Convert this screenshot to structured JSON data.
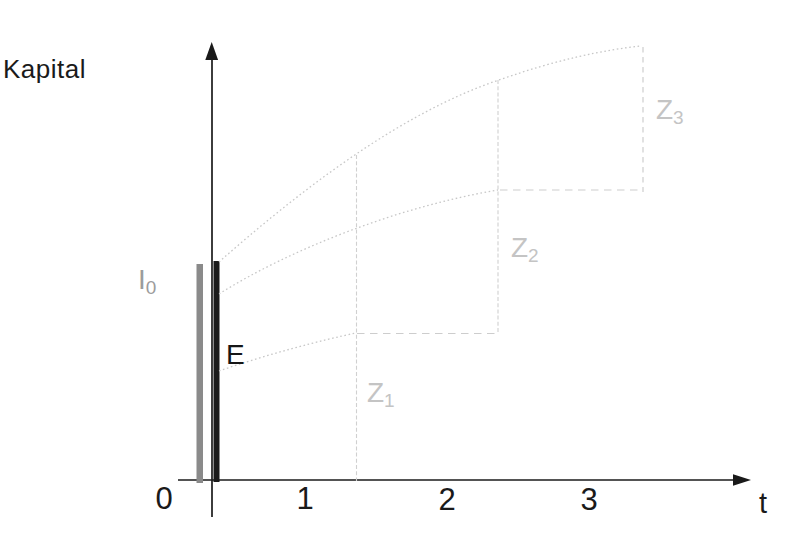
{
  "chart_data": {
    "type": "line",
    "title": "",
    "xlabel": "t",
    "ylabel": "Kapital",
    "x_ticks": [
      0,
      1,
      2,
      3
    ],
    "xlim": [
      -0.45,
      4.15
    ],
    "ylim": [
      0,
      2.2
    ],
    "y_scale_note": "no y-axis ticks shown; y values in relative units where initial capital bar I0 = 1.0",
    "grid": false,
    "legend_position": "none",
    "bars": [
      {
        "label": "I0",
        "x": 0.25,
        "height": 0.98,
        "color": "#8a8a8a"
      },
      {
        "label": "E",
        "x": 0.37,
        "height": 1.0,
        "color": "#1a1a1a"
      }
    ],
    "series": [
      {
        "name": "growth path over 3 periods (to Z3)",
        "style": "dotted",
        "x": [
          0.38,
          1.36,
          2.36,
          3.32
        ],
        "y": [
          1.0,
          1.49,
          1.83,
          1.99
        ]
      },
      {
        "name": "growth path over 2 periods (to Z2)",
        "style": "dotted",
        "x": [
          0.38,
          1.36,
          2.36
        ],
        "y": [
          0.85,
          1.16,
          1.32
        ]
      },
      {
        "name": "growth path over 1 period (to Z1)",
        "style": "dotted",
        "x": [
          0.38,
          1.35
        ],
        "y": [
          0.5,
          0.67
        ]
      }
    ],
    "guides": [
      {
        "type": "vline",
        "x": 1.36,
        "from_y": 0.0,
        "to_y": 1.49
      },
      {
        "type": "vline",
        "x": 2.36,
        "from_y": 0.67,
        "to_y": 1.83
      },
      {
        "type": "vline-dashed",
        "x": 3.39,
        "from_y": 1.32,
        "to_y": 1.98
      },
      {
        "type": "hline-dashed",
        "y": 0.67,
        "from_x": 1.36,
        "to_x": 2.36
      },
      {
        "type": "hline-dashed",
        "y": 1.32,
        "from_x": 2.36,
        "to_x": 3.39
      }
    ],
    "annotations": [
      {
        "text": "I0",
        "x": -0.12,
        "y": 0.93
      },
      {
        "text": "E",
        "x": 0.5,
        "y": 0.56
      },
      {
        "text": "Z1",
        "x": 1.5,
        "y": 0.38
      },
      {
        "text": "Z2",
        "x": 2.53,
        "y": 1.04
      },
      {
        "text": "Z3",
        "x": 3.55,
        "y": 1.68
      }
    ]
  },
  "labels": {
    "kapital": "Kapital",
    "t_axis": "t",
    "tick0": "0",
    "tick1": "1",
    "tick2": "2",
    "tick3": "3",
    "e": "E",
    "i0_main": "I",
    "i0_sub": "0",
    "z1_main": "Z",
    "z1_sub": "1",
    "z2_main": "Z",
    "z2_sub": "2",
    "z3_main": "Z",
    "z3_sub": "3"
  },
  "figure": {
    "width": 803,
    "height": 549,
    "colors": {
      "ink": "#1a1a1a",
      "gray_bar": "#8a8a8a",
      "curve": "#c7c7c7",
      "guide": "#d0d0d0",
      "dash": "#cdcdcd"
    },
    "shapes": [
      {
        "name": "y-axis-line",
        "type": "line",
        "x1": 212,
        "y1": 50,
        "x2": 212,
        "y2": 517,
        "stroke": "#1a1a1a",
        "width": 1.7
      },
      {
        "name": "y-axis-arrowhead",
        "type": "polygon",
        "points": "211.7,42 205.3,60 218.1,60",
        "fill": "#1a1a1a"
      },
      {
        "name": "x-axis-line",
        "type": "line",
        "x1": 178,
        "y1": 480,
        "x2": 744,
        "y2": 480,
        "stroke": "#1a1a1a",
        "width": 1.7
      },
      {
        "name": "x-axis-arrowhead",
        "type": "polygon",
        "points": "751,480 733,474.2 733,485.8",
        "fill": "#1a1a1a"
      },
      {
        "name": "initial-capital-bar",
        "type": "rect",
        "x": 196.5,
        "y": 264,
        "w": 6.5,
        "h": 219,
        "fill": "#8a8a8a"
      },
      {
        "name": "deposit-bar",
        "type": "rect",
        "x": 213.5,
        "y": 261,
        "w": 6,
        "h": 221,
        "fill": "#1a1a1a"
      },
      {
        "name": "growth-curve-period1",
        "type": "path",
        "d": "M219,371 C265,355 322,340 356,333",
        "stroke": "#c7c7c7",
        "width": 1.3,
        "dash": "1.6 2.6"
      },
      {
        "name": "growth-curve-period2",
        "type": "path",
        "d": "M219,294 C292,248 402,206 498,190",
        "stroke": "#c7c7c7",
        "width": 1.3,
        "dash": "1.6 2.6"
      },
      {
        "name": "growth-curve-period3",
        "type": "path",
        "d": "M219,262 C295,195 400,112 502,79 C556,60 603,50 641,46",
        "stroke": "#c7c7c7",
        "width": 1.3,
        "dash": "1.6 2.6"
      },
      {
        "name": "guide-vline-z1",
        "type": "line",
        "x1": 356.5,
        "y1": 155,
        "x2": 356.5,
        "y2": 481,
        "stroke": "#d0d0d0",
        "width": 1.1,
        "dash": "4 2.2"
      },
      {
        "name": "guide-vline-z2",
        "type": "line",
        "x1": 498,
        "y1": 80,
        "x2": 498,
        "y2": 334,
        "stroke": "#d0d0d0",
        "width": 1.1,
        "dash": "4 2.2"
      },
      {
        "name": "guide-vline-dashed-z3",
        "type": "line",
        "x1": 643,
        "y1": 47,
        "x2": 643,
        "y2": 192,
        "stroke": "#cdcdcd",
        "width": 1.2,
        "dash": "5.5 4.5"
      },
      {
        "name": "guide-hline-dashed-low",
        "type": "line",
        "x1": 357,
        "y1": 333.5,
        "x2": 498,
        "y2": 333.5,
        "stroke": "#cdcdcd",
        "width": 1.2,
        "dash": "7.5 5.5"
      },
      {
        "name": "guide-hline-dashed-mid",
        "type": "line",
        "x1": 500,
        "y1": 190,
        "x2": 643,
        "y2": 190,
        "stroke": "#cdcdcd",
        "width": 1.2,
        "dash": "7.5 5.5"
      }
    ]
  }
}
